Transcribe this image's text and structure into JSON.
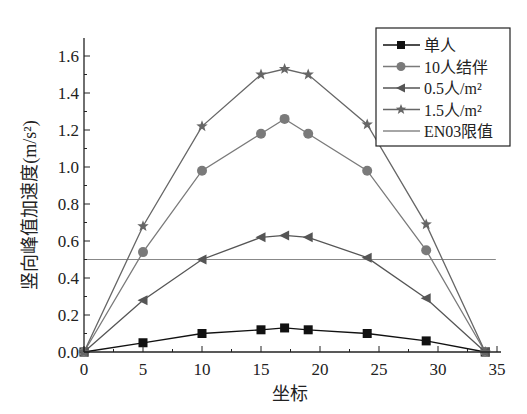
{
  "chart_data": {
    "type": "line",
    "title": "",
    "xlabel": "坐标",
    "ylabel": "竖向峰值加速度(m/s²)",
    "xlim": [
      0,
      35
    ],
    "ylim": [
      0,
      1.7
    ],
    "x_ticks": [
      "0",
      "5",
      "10",
      "15",
      "20",
      "25",
      "30",
      "35"
    ],
    "y_ticks": [
      "0.0",
      "0.2",
      "0.4",
      "0.6",
      "0.8",
      "1.0",
      "1.2",
      "1.4",
      "1.6"
    ],
    "grid": false,
    "legend_position": "upper right",
    "x": [
      0,
      5,
      10,
      15,
      17,
      19,
      24,
      29,
      34
    ],
    "series": [
      {
        "name": "单人",
        "marker": "square",
        "color": "#111111",
        "values": [
          0,
          0.05,
          0.1,
          0.12,
          0.13,
          0.12,
          0.1,
          0.06,
          0
        ]
      },
      {
        "name": "10人结伴",
        "marker": "circle",
        "color": "#7a7a7a",
        "values": [
          0,
          0.54,
          0.98,
          1.18,
          1.26,
          1.18,
          0.98,
          0.55,
          0
        ]
      },
      {
        "name": "0.5人/m²",
        "marker": "triangle-left",
        "color": "#555555",
        "values": [
          0,
          0.28,
          0.5,
          0.62,
          0.63,
          0.62,
          0.51,
          0.29,
          0
        ]
      },
      {
        "name": "1.5人/m²",
        "marker": "star",
        "color": "#666666",
        "values": [
          0,
          0.68,
          1.22,
          1.5,
          1.53,
          1.5,
          1.23,
          0.69,
          0
        ]
      }
    ],
    "reference_lines": [
      {
        "name": "EN03限值",
        "y": 0.5,
        "color": "#888888"
      }
    ]
  },
  "legend": {
    "items": [
      "单人",
      "10人结伴",
      "0.5人/m²",
      "1.5人/m²",
      "EN03限值"
    ]
  },
  "axes": {
    "xlabel": "坐标",
    "ylabel_main": "竖向峰值加速度",
    "ylabel_unit": "(m/s²)"
  }
}
